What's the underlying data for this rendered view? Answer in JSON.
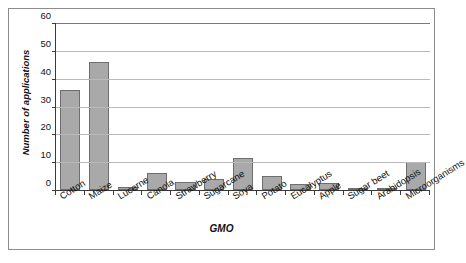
{
  "chart_data": {
    "type": "bar",
    "title": "",
    "xlabel": "GMO",
    "ylabel": "Number of applications",
    "categories": [
      "Cotton",
      "Maize",
      "Lucerne",
      "Canola",
      "Strawberry",
      "Sugarcane",
      "Soya",
      "Potato",
      "Eucalyptus",
      "Apple",
      "Sugar beet",
      "Arabidopsis",
      "Microorganisms"
    ],
    "values": [
      36,
      46,
      1,
      6,
      3,
      4,
      11.5,
      5,
      2,
      2.5,
      0.5,
      0.5,
      10
    ],
    "ylim": [
      0,
      60
    ],
    "yticks": [
      0,
      10,
      20,
      30,
      40,
      50,
      60
    ],
    "ytick_labels": [
      "0",
      "10",
      "20",
      "30",
      "40",
      "50",
      "60"
    ],
    "grid": true,
    "legend": "none",
    "bar_color": "#a9a9a9",
    "bar_border_color": "#6e6e6e",
    "grid_color": "#b9b9b9",
    "axis_color": "#3a3a3a",
    "frame_color": "#8c8c8c",
    "background": "#ffffff"
  }
}
